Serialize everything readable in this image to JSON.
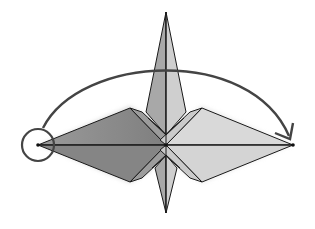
{
  "diagram": {
    "type": "origami-fold-step",
    "description": "Crane base viewed from above: rotate/flip the left wing point over to the right",
    "colors": {
      "background": "#ffffff",
      "outline": "#1a1a1a",
      "dark_face": "#8a8a8a",
      "medium_face": "#b5b5b5",
      "light_face": "#d9d9d9",
      "arrow": "#444444",
      "shadow": "#cfcfcf"
    },
    "points": {
      "center": [
        166,
        145
      ],
      "top_tip": [
        166,
        12
      ],
      "bottom_tip": [
        166,
        213
      ],
      "left_tip": [
        38,
        145
      ],
      "right_tip": [
        293,
        145
      ]
    },
    "annotations": {
      "circle_marker": {
        "label": "target-point-circle",
        "center": [
          38,
          145
        ],
        "radius": 17
      },
      "fold_arrow": {
        "label": "rotate-arrow",
        "from": [
          42,
          128
        ],
        "to": [
          290,
          140
        ]
      }
    }
  }
}
